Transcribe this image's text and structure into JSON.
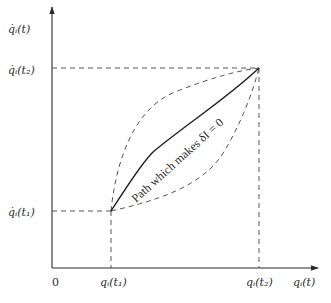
{
  "diagram": {
    "axes": {
      "y_label": "q̇ᵢ(t)",
      "x_label": "qᵢ(t)",
      "origin_label": "0"
    },
    "ticks": {
      "y_t2": "q̇ᵢ(t₂)",
      "y_t1": "q̇ᵢ(t₁)",
      "x_t1": "qᵢ(t₁)",
      "x_t2": "qᵢ(t₂)"
    },
    "curves": {
      "actual_path_label": "Path which makes δI = 0"
    },
    "colors": {
      "line": "#2a2a2a",
      "dashed": "#555555",
      "background": "#ffffff"
    },
    "points": {
      "start": {
        "x": 111,
        "y": 211
      },
      "end": {
        "x": 259,
        "y": 68
      }
    }
  }
}
